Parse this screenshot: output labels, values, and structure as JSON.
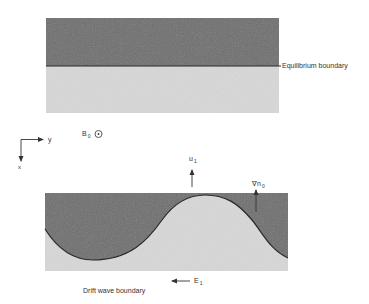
{
  "figure": {
    "equilibrium_panel": {
      "boundary_label": "Equilibrium boundary",
      "upper_region_color": "#6e6e6e",
      "lower_region_color": "#d6d6d6"
    },
    "coordinate_axes": {
      "horizontal_axis": "y",
      "vertical_axis": "x"
    },
    "magnetic_field": {
      "symbol": "B",
      "subscript": "0",
      "direction_symbol": "⊙"
    },
    "drift_wave_panel": {
      "boundary_label": "Drift wave boundary",
      "velocity_label": "u",
      "velocity_subscript": "1",
      "gradient_label": "∇n",
      "gradient_subscript": "0",
      "field_label": "E",
      "field_subscript": "1",
      "upper_region_color": "#6e6e6e",
      "lower_region_color": "#d6d6d6"
    }
  }
}
